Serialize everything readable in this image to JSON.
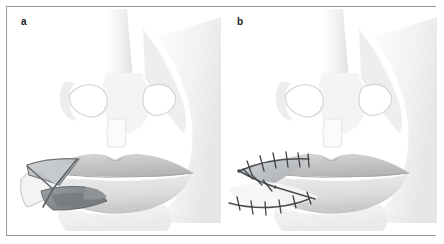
{
  "figure": {
    "type": "medical-illustration",
    "border_color": "#9a9a9a",
    "background_color": "#ffffff",
    "width": 444,
    "height": 244
  },
  "panels": [
    {
      "id": "a",
      "label": "a",
      "caption_text": "a",
      "description": "Frontal view of nose and lips with V-shaped incision outlined at the left lower lip; triangular flap elevated showing undersurface",
      "features": [
        "nose",
        "nostrils",
        "philtrum",
        "upper lip",
        "lower lip",
        "teeth",
        "V-shaped incision",
        "elevated triangular flap"
      ]
    },
    {
      "id": "b",
      "label": "b",
      "caption_text": "b",
      "description": "Frontal view of nose and lips after closure; interrupted sutures along the Y-shaped closure line at the left lower lip",
      "features": [
        "nose",
        "nostrils",
        "philtrum",
        "upper lip",
        "lower lip",
        "Y-shaped suture line",
        "interrupted sutures"
      ],
      "suture_count_upper_limb": 6,
      "suture_count_lower_limb": 6
    }
  ],
  "palette": {
    "outline": "#6e7276",
    "skin_light": "#f6f6f6",
    "skin_mid": "#e8e8e8",
    "skin_shadow": "#d8d8d8",
    "lip_upper": "#c9c9c9",
    "lip_lower": "#e3e3e3",
    "teeth": "#fcfcfc",
    "flap_dark": "#8d9094",
    "flap_mid": "#b4b7b9",
    "suture_line": "#4a4e52",
    "label_color": "#1a1a1a"
  }
}
